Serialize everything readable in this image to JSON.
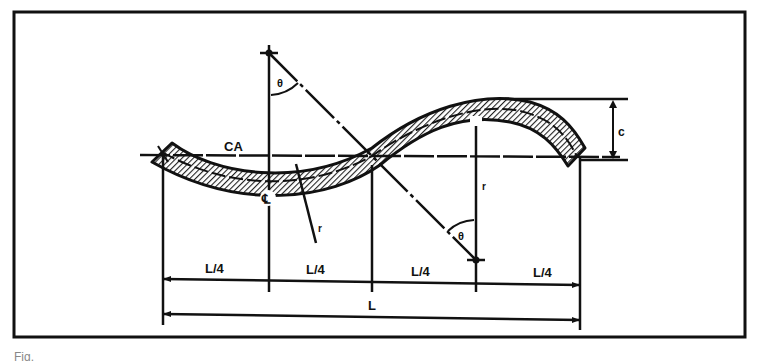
{
  "diagram": {
    "type": "engineering-drawing",
    "labels": {
      "axis": "CA",
      "angle_top": "θ",
      "angle_bottom": "θ",
      "centerline": "℄",
      "radius": "r",
      "radius_right": "r",
      "offset": "c",
      "quarter_1": "L/4",
      "quarter_2": "L/4",
      "quarter_3": "L/4",
      "quarter_4": "L/4",
      "total_length": "L"
    },
    "colors": {
      "ink": "#111111",
      "hatch": "#222222",
      "paper": "#ffffff"
    }
  },
  "caption": {
    "text": "Fig."
  }
}
